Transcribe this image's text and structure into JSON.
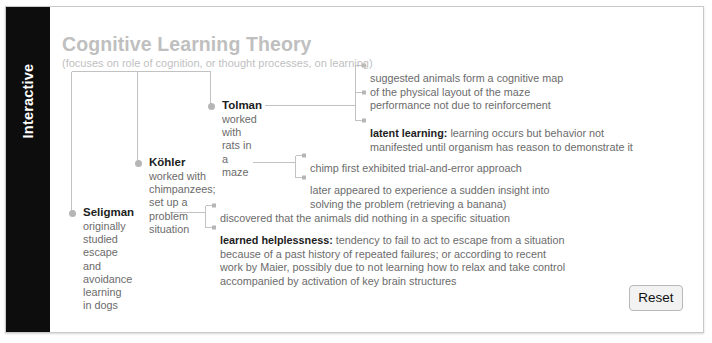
{
  "bleed_text": "p p p p p g",
  "side_tab": {
    "label": "Interactive"
  },
  "diagram": {
    "title": "Cognitive Learning Theory",
    "subtitle": "(focuses on role of cognition, or thought processes, on learning)",
    "nodes": [
      {
        "key": "tolman",
        "name": "Tolman",
        "desc": "worked with rats in a maze",
        "details": [
          {
            "term": "",
            "text": "suggested animals form a cognitive map\nof the physical layout of the maze"
          },
          {
            "term": "",
            "text": "performance not due to reinforcement"
          },
          {
            "term": "latent learning:",
            "text": " learning occurs but behavior not\nmanifested until organism has reason to demonstrate it"
          }
        ]
      },
      {
        "key": "kohler",
        "name": "Köhler",
        "desc": "worked with chimpanzees;\nset up a problem situation",
        "details": [
          {
            "term": "",
            "text": "chimp first exhibited trial-and-error approach"
          },
          {
            "term": "",
            "text": "later appeared to experience a sudden insight into\nsolving the problem (retrieving a banana)"
          }
        ]
      },
      {
        "key": "seligman",
        "name": "Seligman",
        "desc": "originally studied\nescape and avoidance\nlearning in dogs",
        "details": [
          {
            "term": "",
            "text": "discovered that the animals did nothing in a specific situation"
          },
          {
            "term": "learned helplessness:",
            "text": " tendency to fail to act to escape from a situation\nbecause of a past history of repeated failures; or according to recent\nwork by Maier, possibly due to not learning how to relax and take control\naccompanied by activation of key brain structures"
          }
        ]
      }
    ]
  },
  "controls": {
    "reset_label": "Reset"
  },
  "colors": {
    "tab_bg": "#0d0d0d",
    "title": "#bfbfbf",
    "body_text": "#6b6b6b",
    "term_text": "#1d1d1d",
    "wire": "#c2c2c2",
    "dot": "#b6b6b6",
    "card_border": "#c9c9c9"
  }
}
